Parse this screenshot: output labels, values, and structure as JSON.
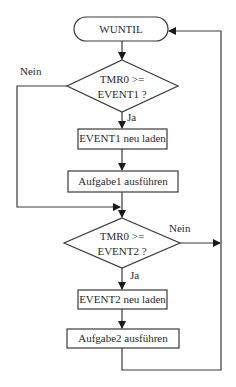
{
  "flowchart": {
    "start": {
      "label": "WUNTIL"
    },
    "decision1": {
      "line1": "TMR0  >=",
      "line2": "EVENT1 ?",
      "no_label": "Nein",
      "yes_label": "Ja"
    },
    "process1": {
      "label": "EVENT1 neu laden"
    },
    "process2": {
      "label": "Aufgabe1 ausführen"
    },
    "decision2": {
      "line1": "TMR0  >=",
      "line2": "EVENT2 ?",
      "no_label": "Nein",
      "yes_label": "Ja"
    },
    "process3": {
      "label": "EVENT2 neu laden"
    },
    "process4": {
      "label": "Aufgabe2 ausführen"
    }
  }
}
